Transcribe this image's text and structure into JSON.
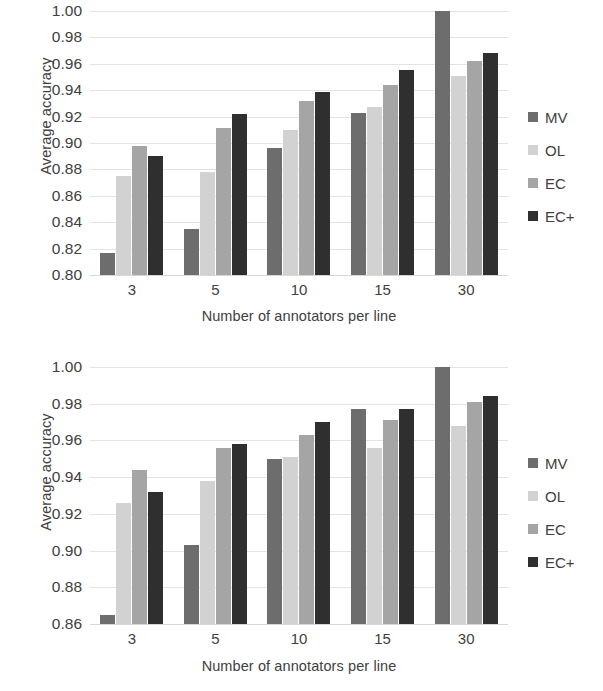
{
  "figure": {
    "panels": [
      {
        "id": "top",
        "ylabel": "Average accuracy",
        "xlabel": "Number of annotators per line",
        "yticks": [
          "1.00",
          "0.98",
          "0.96",
          "0.94",
          "0.92",
          "0.90",
          "0.88",
          "0.86",
          "0.84",
          "0.82",
          "0.80"
        ],
        "xticks": [
          "3",
          "5",
          "10",
          "15",
          "30"
        ],
        "legend": [
          {
            "label": "MV",
            "color": "#6d6d6d"
          },
          {
            "label": "OL",
            "color": "#d2d2d2"
          },
          {
            "label": "EC",
            "color": "#a5a5a5"
          },
          {
            "label": "EC+",
            "color": "#2f2f2f"
          }
        ]
      },
      {
        "id": "bottom",
        "ylabel": "Average accuracy",
        "xlabel": "Number of annotators per line",
        "yticks": [
          "1.00",
          "0.98",
          "0.96",
          "0.94",
          "0.92",
          "0.90",
          "0.88",
          "0.86"
        ],
        "xticks": [
          "3",
          "5",
          "10",
          "15",
          "30"
        ],
        "legend": [
          {
            "label": "MV",
            "color": "#6d6d6d"
          },
          {
            "label": "OL",
            "color": "#d2d2d2"
          },
          {
            "label": "EC",
            "color": "#a5a5a5"
          },
          {
            "label": "EC+",
            "color": "#2f2f2f"
          }
        ]
      }
    ]
  },
  "chart_data": [
    {
      "type": "bar",
      "title": "",
      "panel": "top",
      "xlabel": "Number of annotators per line",
      "ylabel": "Average accuracy",
      "categories": [
        "3",
        "5",
        "10",
        "15",
        "30"
      ],
      "ylim": [
        0.8,
        1.0
      ],
      "ytick_step": 0.02,
      "grid": true,
      "legend_position": "right",
      "series": [
        {
          "name": "MV",
          "color": "#6d6d6d",
          "values": [
            0.817,
            0.835,
            0.896,
            0.923,
            1.0
          ]
        },
        {
          "name": "OL",
          "color": "#d2d2d2",
          "values": [
            0.875,
            0.878,
            0.91,
            0.927,
            0.951
          ]
        },
        {
          "name": "EC",
          "color": "#a5a5a5",
          "values": [
            0.898,
            0.911,
            0.932,
            0.944,
            0.962
          ]
        },
        {
          "name": "EC+",
          "color": "#2f2f2f",
          "values": [
            0.89,
            0.922,
            0.939,
            0.955,
            0.968
          ]
        }
      ]
    },
    {
      "type": "bar",
      "title": "",
      "panel": "bottom",
      "xlabel": "Number of annotators per line",
      "ylabel": "Average accuracy",
      "categories": [
        "3",
        "5",
        "10",
        "15",
        "30"
      ],
      "ylim": [
        0.86,
        1.0
      ],
      "ytick_step": 0.02,
      "grid": true,
      "legend_position": "right",
      "series": [
        {
          "name": "MV",
          "color": "#6d6d6d",
          "values": [
            0.865,
            0.903,
            0.95,
            0.977,
            1.0
          ]
        },
        {
          "name": "OL",
          "color": "#d2d2d2",
          "values": [
            0.926,
            0.938,
            0.951,
            0.956,
            0.968
          ]
        },
        {
          "name": "EC",
          "color": "#a5a5a5",
          "values": [
            0.944,
            0.956,
            0.963,
            0.971,
            0.981
          ]
        },
        {
          "name": "EC+",
          "color": "#2f2f2f",
          "values": [
            0.932,
            0.958,
            0.97,
            0.977,
            0.984
          ]
        }
      ]
    }
  ]
}
